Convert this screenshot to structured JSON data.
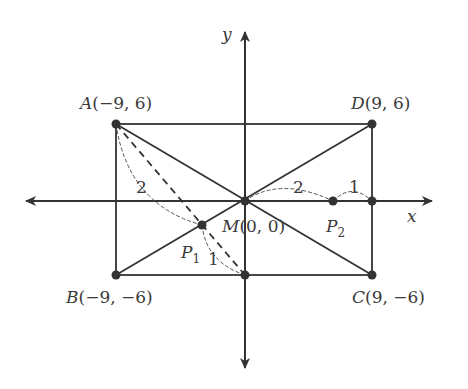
{
  "diagram": {
    "axes": {
      "x_label": "x",
      "y_label": "y"
    },
    "points": {
      "A": {
        "name": "A",
        "coords": "(−9, 6)"
      },
      "B": {
        "name": "B",
        "coords": "(−9, −6)"
      },
      "C": {
        "name": "C",
        "coords": "(9, −6)"
      },
      "D": {
        "name": "D",
        "coords": "(9, 6)"
      },
      "M": {
        "name": "M",
        "coords": "(0, 0)"
      },
      "P1": {
        "name": "P",
        "sub": "1"
      },
      "P2": {
        "name": "P",
        "sub": "2"
      }
    },
    "ratio_labels": {
      "left_big": "2",
      "left_small": "1",
      "right_big": "2",
      "right_small": "1"
    },
    "colors": {
      "stroke": "#333333",
      "text": "#3a3a3a"
    }
  }
}
